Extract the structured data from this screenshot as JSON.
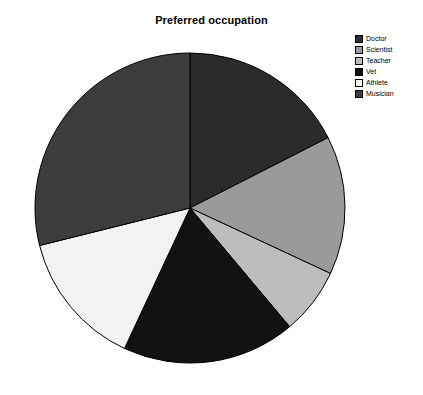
{
  "chart_data": {
    "type": "pie",
    "title": "Preferred occupation",
    "xlabel": "",
    "ylabel": "",
    "legend_position": "top-right",
    "grid": false,
    "start_angle_deg": 0,
    "direction": "clockwise",
    "categories": [
      "Doctor",
      "Scientist",
      "Teacher",
      "Vet",
      "Athlete",
      "Musician"
    ],
    "values": [
      17.5,
      14.4,
      7.0,
      18.1,
      14.2,
      28.8
    ],
    "angles_deg": [
      63,
      52,
      25,
      65,
      51,
      104
    ],
    "colors": [
      "#2b2b2b",
      "#9a9a9a",
      "#bdbdbd",
      "#121212",
      "#f2f2f2",
      "#3d3d3d"
    ],
    "slices": [
      {
        "label": "Doctor",
        "value": 17.5,
        "angle_deg": 63,
        "start_deg": 0,
        "end_deg": 63,
        "color": "#2b2b2b"
      },
      {
        "label": "Scientist",
        "value": 14.4,
        "angle_deg": 52,
        "start_deg": 63,
        "end_deg": 115,
        "color": "#9a9a9a"
      },
      {
        "label": "Teacher",
        "value": 7.0,
        "angle_deg": 25,
        "start_deg": 115,
        "end_deg": 140,
        "color": "#bdbdbd"
      },
      {
        "label": "Vet",
        "value": 18.1,
        "angle_deg": 65,
        "start_deg": 140,
        "end_deg": 205,
        "color": "#121212"
      },
      {
        "label": "Athlete",
        "value": 14.2,
        "angle_deg": 51,
        "start_deg": 205,
        "end_deg": 256,
        "color": "#f2f2f2"
      },
      {
        "label": "Musician",
        "value": 28.8,
        "angle_deg": 104,
        "start_deg": 256,
        "end_deg": 360,
        "color": "#3d3d3d"
      }
    ],
    "geometry": {
      "center_x": 190,
      "center_y": 208,
      "radius": 155
    },
    "edge_color": "#000000"
  },
  "legend": {
    "items": [
      {
        "label": "Doctor",
        "color": "#2b2b2b"
      },
      {
        "label": "Scientist",
        "color": "#9a9a9a"
      },
      {
        "label": "Teacher",
        "color": "#bdbdbd"
      },
      {
        "label": "Vet",
        "color": "#121212"
      },
      {
        "label": "Athlete",
        "color": "#f2f2f2"
      },
      {
        "label": "Musician",
        "color": "#3d3d3d"
      }
    ]
  }
}
